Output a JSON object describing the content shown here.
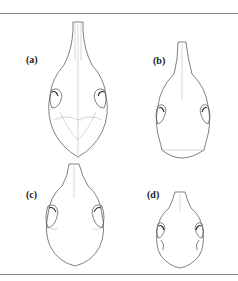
{
  "figure": {
    "panels": [
      {
        "id": "a",
        "label": "(a)",
        "description": "skull dorsal view, large elongated"
      },
      {
        "id": "b",
        "label": "(b)",
        "description": "skull dorsal view, narrow snout"
      },
      {
        "id": "c",
        "label": "(c)",
        "description": "skull dorsal view, broad"
      },
      {
        "id": "d",
        "label": "(d)",
        "description": "skull dorsal view, small"
      }
    ],
    "colors": {
      "line": "#4a4a4a",
      "rule": "#8a8a8a",
      "background": "#ffffff"
    }
  }
}
